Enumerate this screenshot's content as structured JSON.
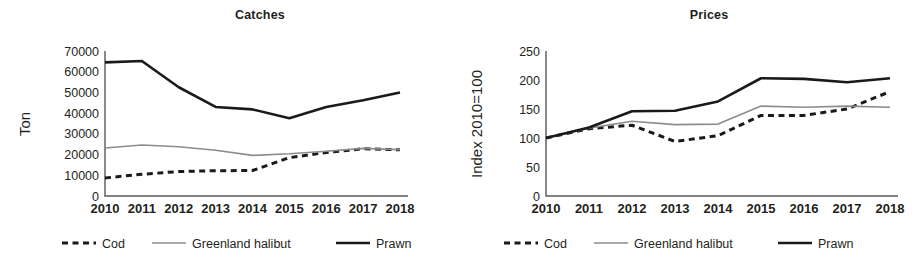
{
  "figure": {
    "panels": [
      "catches",
      "prices"
    ],
    "colors": {
      "cod": "#1a1a1a",
      "greenland_halibut": "#8c8c8c",
      "prawn": "#1a1a1a",
      "axis": "#58595b",
      "text": "#231f20"
    }
  },
  "legend": {
    "items": [
      {
        "label": "Cod",
        "series": "cod",
        "style": "dashed"
      },
      {
        "label": "Greenland halibut",
        "series": "greenland_halibut",
        "style": "solid-thin"
      },
      {
        "label": "Prawn",
        "series": "prawn",
        "style": "solid-thick"
      }
    ]
  },
  "chart_data": [
    {
      "id": "catches",
      "type": "line",
      "title": "Catches",
      "xlabel": "",
      "ylabel": "Ton",
      "categories": [
        "2010",
        "2011",
        "2012",
        "2013",
        "2014",
        "2015",
        "2016",
        "2017",
        "2018"
      ],
      "x": [
        2010,
        2011,
        2012,
        2013,
        2014,
        2015,
        2016,
        2017,
        2018
      ],
      "ylim": [
        0,
        70000
      ],
      "yticks": [
        0,
        10000,
        20000,
        30000,
        40000,
        50000,
        60000,
        70000
      ],
      "ytick_labels": [
        "0",
        "10000",
        "20000",
        "30000",
        "40000",
        "50000",
        "60000",
        "70000"
      ],
      "grid": false,
      "legend_position": "bottom",
      "series": [
        {
          "name": "Cod",
          "key": "cod",
          "style": "dashed",
          "values": [
            8700,
            10500,
            11800,
            12200,
            12300,
            18500,
            21000,
            22800,
            22300
          ]
        },
        {
          "name": "Greenland halibut",
          "key": "greenland_halibut",
          "style": "solid-thin",
          "values": [
            23200,
            24600,
            23800,
            22100,
            19600,
            20400,
            21600,
            23000,
            22400
          ]
        },
        {
          "name": "Prawn",
          "key": "prawn",
          "style": "solid-thick",
          "values": [
            64500,
            65200,
            52500,
            43000,
            41800,
            37500,
            43000,
            46200,
            50000
          ]
        }
      ]
    },
    {
      "id": "prices",
      "type": "line",
      "title": "Prices",
      "xlabel": "",
      "ylabel": "Index 2010=100",
      "categories": [
        "2010",
        "2011",
        "2012",
        "2013",
        "2014",
        "2015",
        "2016",
        "2017",
        "2018"
      ],
      "x": [
        2010,
        2011,
        2012,
        2013,
        2014,
        2015,
        2016,
        2017,
        2018
      ],
      "ylim": [
        0,
        250
      ],
      "yticks": [
        0,
        50,
        100,
        150,
        200,
        250
      ],
      "ytick_labels": [
        "0",
        "50",
        "100",
        "150",
        "200",
        "250"
      ],
      "grid": false,
      "legend_position": "bottom",
      "series": [
        {
          "name": "Cod",
          "key": "cod",
          "style": "dashed",
          "values": [
            100,
            116,
            122,
            94,
            104,
            139,
            139,
            150,
            180
          ]
        },
        {
          "name": "Greenland halibut",
          "key": "greenland_halibut",
          "style": "solid-thin",
          "values": [
            100,
            117,
            129,
            123,
            124,
            155,
            153,
            155,
            153
          ]
        },
        {
          "name": "Prawn",
          "key": "prawn",
          "style": "solid-thick",
          "values": [
            100,
            118,
            146,
            147,
            163,
            203,
            202,
            196,
            203
          ]
        }
      ]
    }
  ]
}
